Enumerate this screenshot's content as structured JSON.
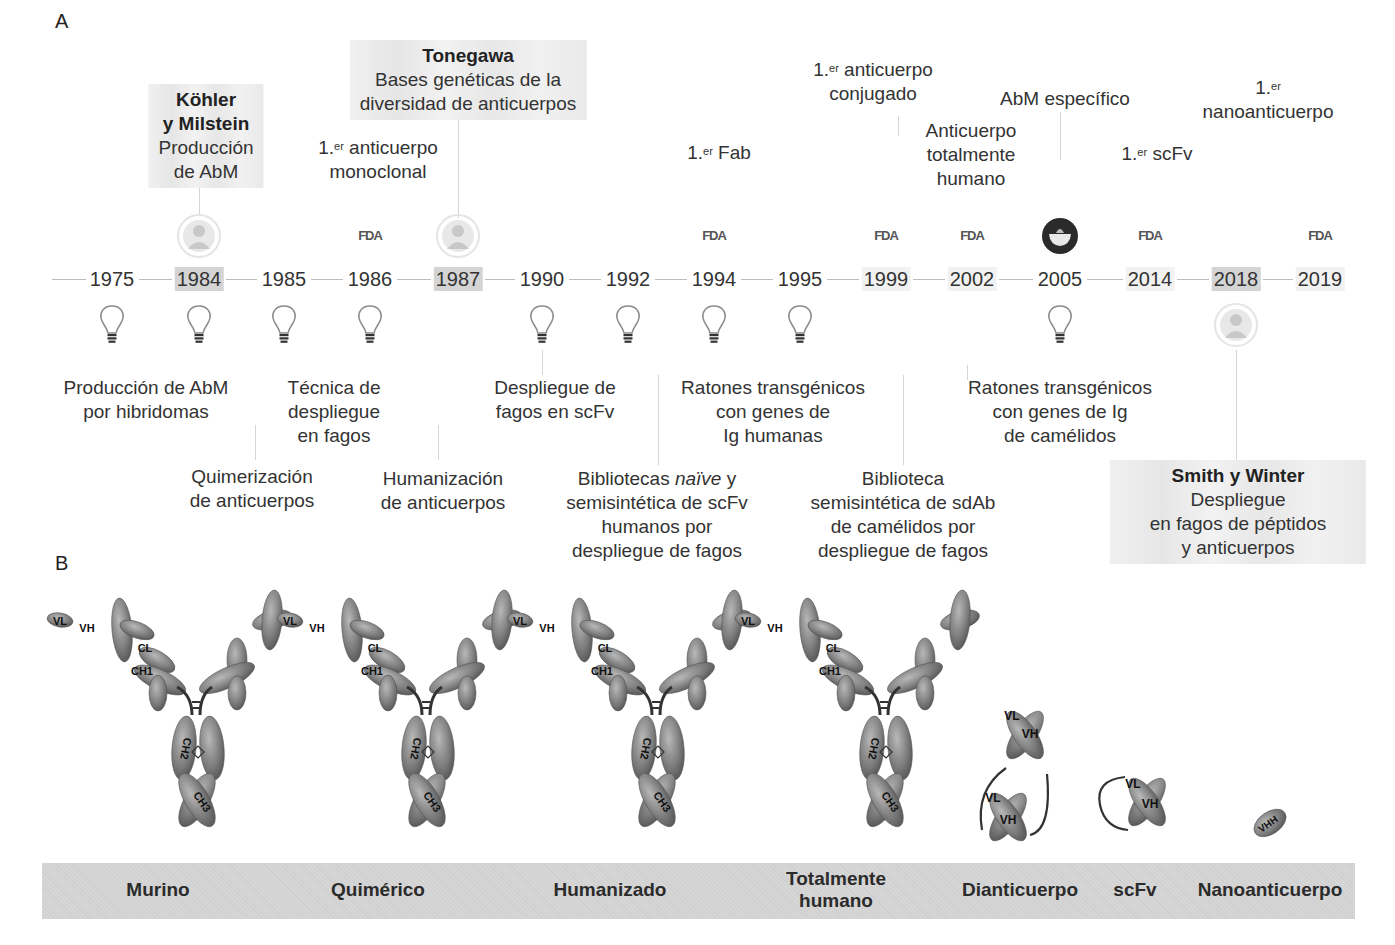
{
  "panel_a": {
    "letter": "A",
    "timeline_years": [
      {
        "year": "1975",
        "highlight": "none"
      },
      {
        "year": "1984",
        "highlight": "strong"
      },
      {
        "year": "1985",
        "highlight": "none"
      },
      {
        "year": "1986",
        "highlight": "none"
      },
      {
        "year": "1987",
        "highlight": "strong"
      },
      {
        "year": "1990",
        "highlight": "none"
      },
      {
        "year": "1992",
        "highlight": "none"
      },
      {
        "year": "1994",
        "highlight": "none"
      },
      {
        "year": "1995",
        "highlight": "none"
      },
      {
        "year": "1999",
        "highlight": "soft"
      },
      {
        "year": "2002",
        "highlight": "soft"
      },
      {
        "year": "2005",
        "highlight": "none"
      },
      {
        "year": "2014",
        "highlight": "soft"
      },
      {
        "year": "2018",
        "highlight": "strong"
      },
      {
        "year": "2019",
        "highlight": "soft"
      }
    ],
    "icons_above": [
      {
        "year": "1984",
        "icon": "person-portrait-icon"
      },
      {
        "year": "1986",
        "icon": "fda-logo-icon",
        "text": "FDA"
      },
      {
        "year": "1987",
        "icon": "person-portrait-icon"
      },
      {
        "year": "1994",
        "icon": "fda-logo-icon",
        "text": "FDA"
      },
      {
        "year": "1999",
        "icon": "fda-logo-icon",
        "text": "FDA"
      },
      {
        "year": "2002",
        "icon": "fda-logo-icon",
        "text": "FDA"
      },
      {
        "year": "2005",
        "icon": "mortar-bowl-icon"
      },
      {
        "year": "2014",
        "icon": "fda-logo-icon",
        "text": "FDA"
      },
      {
        "year": "2019",
        "icon": "fda-logo-icon",
        "text": "FDA"
      }
    ],
    "icons_below": [
      {
        "year": "1975",
        "icon": "lightbulb-icon"
      },
      {
        "year": "1984",
        "icon": "lightbulb-icon"
      },
      {
        "year": "1985",
        "icon": "lightbulb-icon"
      },
      {
        "year": "1986",
        "icon": "lightbulb-icon"
      },
      {
        "year": "1990",
        "icon": "lightbulb-icon"
      },
      {
        "year": "1992",
        "icon": "lightbulb-icon"
      },
      {
        "year": "1994",
        "icon": "lightbulb-icon"
      },
      {
        "year": "1995",
        "icon": "lightbulb-icon"
      },
      {
        "year": "2005",
        "icon": "lightbulb-icon"
      },
      {
        "year": "2018",
        "icon": "person-portrait-icon"
      }
    ],
    "top_labels": {
      "kohler": {
        "name_line1": "Köhler",
        "name_line2": "y Milstein",
        "line3": "Producción",
        "line4": "de AbM"
      },
      "tonegawa": {
        "name": "Tonegawa",
        "line2": "Bases genéticas de la",
        "line3": "diversidad de anticuerpos"
      },
      "first_mab": {
        "prefix": "1.",
        "sup": "er",
        "line1": " anticuerpo",
        "line2": "monoclonal"
      },
      "first_fab": {
        "prefix": "1.",
        "sup": "er",
        "line1": " Fab"
      },
      "first_conjugated": {
        "prefix": "1.",
        "sup": "er",
        "line1": " anticuerpo",
        "line2": "conjugado"
      },
      "fully_human": {
        "line1": "Anticuerpo",
        "line2": "totalmente",
        "line3": "humano"
      },
      "specific_mab": {
        "line1": "AbM específico"
      },
      "first_scfv": {
        "prefix": "1.",
        "sup": "er",
        "line1": " scFv"
      },
      "first_nano": {
        "prefix": "1.",
        "sup": "er",
        "line2": "nanoanticuerpo"
      }
    },
    "bottom_labels": {
      "hybridoma": {
        "line1": "Producción de AbM",
        "line2": "por hibridomas"
      },
      "phage_tech": {
        "line1": "Técnica de",
        "line2": "despliegue",
        "line3": "en fagos"
      },
      "chimerization": {
        "line1": "Quimerización",
        "line2": "de anticuerpos"
      },
      "humanization": {
        "line1": "Humanización",
        "line2": "de anticuerpos"
      },
      "phage_scfv": {
        "line1": "Despliegue de",
        "line2": "fagos en scFv"
      },
      "naive_libs": {
        "line1a": "Bibliotecas ",
        "line1b": "naïve",
        "line1c": " y",
        "line2": "semisintética de scFv",
        "line3": "humanos por",
        "line4": "despliegue de fagos"
      },
      "transgenic_human": {
        "line1": "Ratones transgénicos",
        "line2": "con genes de",
        "line3": "Ig humanas"
      },
      "sdab_lib": {
        "line1": "Biblioteca",
        "line2": "semisintética de sdAb",
        "line3": "de camélidos por",
        "line4": "despliegue de fagos"
      },
      "transgenic_camelid": {
        "line1": "Ratones transgénicos",
        "line2": "con genes de Ig",
        "line3": "de camélidos"
      },
      "smith_winter": {
        "name": "Smith y Winter",
        "line2": "Despliegue",
        "line3": "en fagos de péptidos",
        "line4": "y anticuerpos"
      }
    }
  },
  "panel_b": {
    "letter": "B",
    "formats": [
      {
        "label": "Murino",
        "variant": "murine"
      },
      {
        "label": "Quimérico",
        "variant": "chimeric"
      },
      {
        "label": "Humanizado",
        "variant": "humanized"
      },
      {
        "label_line1": "Totalmente",
        "label_line2": "humano",
        "variant": "human"
      },
      {
        "label": "Dianticuerpo",
        "variant": "diabody"
      },
      {
        "label": "scFv",
        "variant": "scfv"
      },
      {
        "label": "Nanoanticuerpo",
        "variant": "nanobody"
      }
    ],
    "domain_labels": {
      "vl": "VL",
      "vh": "VH",
      "cl": "CL",
      "ch1": "CH1",
      "ch2": "CH2",
      "ch3": "CH3",
      "vhh": "VHH"
    }
  },
  "colors": {
    "domain_fill": "#8a8a8a",
    "highlight": "#d4d4d4",
    "band": "#d2d2d2",
    "text": "#333333"
  }
}
